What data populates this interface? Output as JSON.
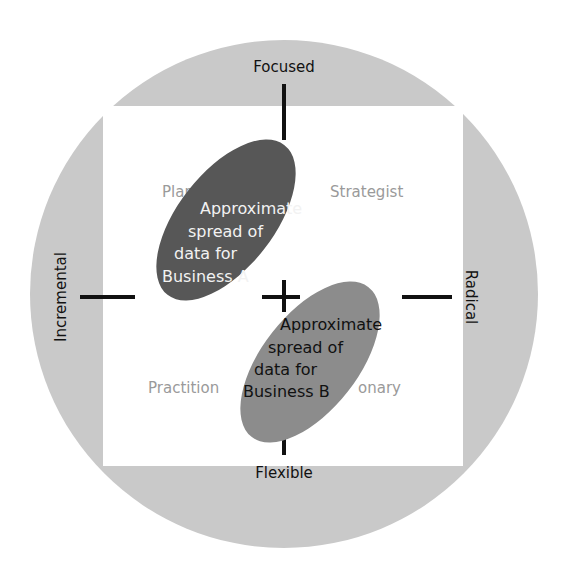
{
  "diagram": {
    "axes": {
      "top": "Focused",
      "bottom": "Flexible",
      "left": "Incremental",
      "right": "Radical"
    },
    "quadrants": {
      "top_left": "Planner",
      "top_right": "Strategist",
      "bottom_left": "Practitioner",
      "bottom_right": "Visionary",
      "top_left_visible": "Plar",
      "bottom_left_visible": "Practition",
      "bottom_right_visible": "onary"
    },
    "ellipses": [
      {
        "name": "Business A",
        "lines": [
          "Approximate",
          "spread of",
          "data for",
          "Business A"
        ],
        "fill": "#575757",
        "text_color": "#f2f2f2"
      },
      {
        "name": "Business B",
        "lines": [
          "Approximate",
          "spread of",
          "data for",
          "Business B"
        ],
        "fill": "#8c8c8c",
        "text_color": "#111111"
      }
    ],
    "colors": {
      "circle": "#c9c9c9",
      "square": "#ffffff",
      "axis": "#111111",
      "quadrant_text": "#9a9a9a"
    }
  }
}
